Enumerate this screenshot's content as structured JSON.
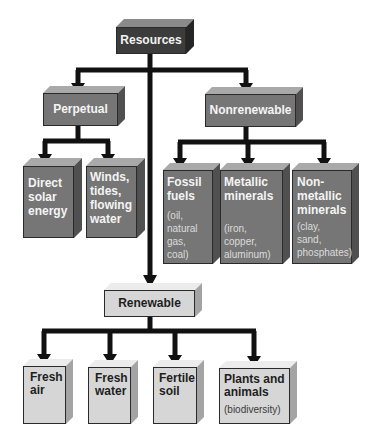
{
  "diagram": {
    "root": {
      "label": "Resources"
    },
    "perpetual": {
      "label": "Perpetual",
      "children": [
        {
          "label": "Direct solar energy",
          "lines": [
            "Direct",
            "solar",
            "energy"
          ]
        },
        {
          "label": "Winds, tides, flowing water",
          "lines": [
            "Winds,",
            "tides,",
            "flowing",
            "water"
          ]
        }
      ]
    },
    "nonrenewable": {
      "label": "Nonrenewable",
      "children": [
        {
          "label": "Fossil fuels",
          "lines": [
            "Fossil",
            "fuels"
          ],
          "examples": [
            "(oil,",
            "natural",
            "gas,",
            "coal)"
          ]
        },
        {
          "label": "Metallic minerals",
          "lines": [
            "Metallic",
            "minerals"
          ],
          "examples": [
            "(iron,",
            "copper,",
            "aluminum)"
          ]
        },
        {
          "label": "Nonmetallic minerals",
          "lines": [
            "Non-",
            "metallic",
            "minerals"
          ],
          "examples": [
            "(clay,",
            "sand,",
            "phosphates)"
          ]
        }
      ]
    },
    "renewable": {
      "label": "Renewable",
      "children": [
        {
          "label": "Fresh air",
          "lines": [
            "Fresh",
            "air"
          ]
        },
        {
          "label": "Fresh water",
          "lines": [
            "Fresh",
            "water"
          ]
        },
        {
          "label": "Fertile soil",
          "lines": [
            "Fertile",
            "soil"
          ]
        },
        {
          "label": "Plants and animals",
          "lines": [
            "Plants and",
            "animals"
          ],
          "examples": [
            "(biodiversity)"
          ]
        }
      ]
    },
    "colors": {
      "root_fill": "#3c3c3c",
      "mid_fill": "#767676",
      "light_fill": "#d6d6d6",
      "connector": "#111111"
    }
  }
}
